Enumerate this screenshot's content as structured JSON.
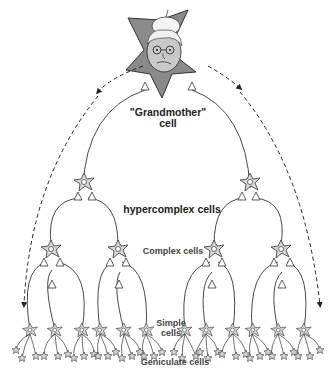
{
  "diagram": {
    "labels": {
      "grandmother_line1": "\"Grandmother\"",
      "grandmother_line2": "cell",
      "hypercomplex": "hypercomplex cells",
      "complex": "Complex cells",
      "simple_line1": "Simple",
      "simple_line2": "cells",
      "geniculate": "Geniculate cells"
    },
    "levels": [
      {
        "name": "Grandmother cell",
        "count": 1
      },
      {
        "name": "Hypercomplex cells",
        "count": 2
      },
      {
        "name": "Complex cells",
        "count": 4
      },
      {
        "name": "Simple cells",
        "count": 12
      },
      {
        "name": "Geniculate cells",
        "count": 36
      }
    ],
    "colors": {
      "cell_fill": "#d6d6d6",
      "grandmother_fill": "#8a8a8a",
      "line": "#333333",
      "text": "#222222"
    }
  }
}
